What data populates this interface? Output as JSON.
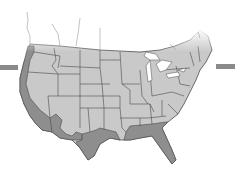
{
  "map": {
    "subject": "Contiguous United States",
    "style": "grayscale state outline map with faded northern border",
    "colors": {
      "background": "#ffffff",
      "land": "#c9c9c9",
      "highlight": "#8e8e8e",
      "border": "#4a4a4a",
      "water": "#ffffff",
      "side_bar": "#8a8a8a"
    },
    "highlighted_regions": [
      "Washington coast",
      "Oregon coast",
      "California",
      "Arizona border",
      "New Mexico border",
      "Texas",
      "Louisiana",
      "Mississippi",
      "Alabama",
      "Georgia",
      "Florida"
    ],
    "side_markers": [
      "left-bar",
      "right-bar"
    ]
  }
}
